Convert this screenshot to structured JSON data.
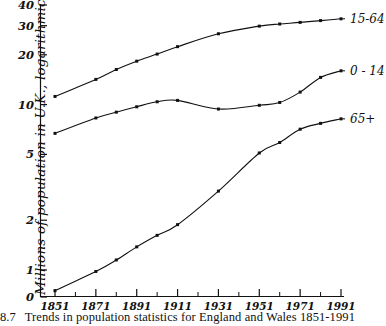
{
  "figure": {
    "caption_number": "8.7",
    "caption_text": "Trends in population statistics for England and Wales 1851-1991",
    "ylabel": "Millions of population in U.K., logarithmic scale"
  },
  "chart_data": {
    "type": "line",
    "title": "",
    "subtitle": "",
    "xlabel": "",
    "ylabel": "Millions of population in U.K., logarithmic scale",
    "yscale": "log",
    "ylim": [
      0.55,
      42
    ],
    "xlim": [
      1851,
      1991
    ],
    "grid": false,
    "legend_position": "right-of-lines",
    "ytick_labels": [
      "0",
      "1",
      "2",
      "5",
      "10",
      "20",
      "30",
      "40"
    ],
    "ytick_values": [
      0,
      1,
      2,
      5,
      10,
      20,
      30,
      40
    ],
    "xtick_labels": [
      "1851",
      "1871",
      "1891",
      "1911",
      "1931",
      "1951",
      "1971",
      "1991"
    ],
    "xtick_values": [
      1851,
      1871,
      1891,
      1911,
      1931,
      1951,
      1971,
      1991
    ],
    "x": [
      1851,
      1871,
      1881,
      1891,
      1901,
      1911,
      1931,
      1951,
      1961,
      1971,
      1981,
      1991
    ],
    "series": [
      {
        "name": "15-64",
        "label": "15-64",
        "color": "#111111",
        "values": [
          11.2,
          14.2,
          16.3,
          18.3,
          20.2,
          22.4,
          26.8,
          29.8,
          30.7,
          31.4,
          32.2,
          33.0
        ]
      },
      {
        "name": "0-14",
        "label": "0 - 14",
        "color": "#111111",
        "values": [
          6.7,
          8.3,
          9.0,
          9.7,
          10.4,
          10.6,
          9.4,
          9.9,
          10.3,
          11.9,
          14.6,
          16.0
        ]
      },
      {
        "name": "65+",
        "label": "65+",
        "color": "#111111",
        "values": [
          0.75,
          0.98,
          1.15,
          1.38,
          1.62,
          1.88,
          3.0,
          5.1,
          5.9,
          7.1,
          7.7,
          8.2
        ]
      }
    ]
  }
}
